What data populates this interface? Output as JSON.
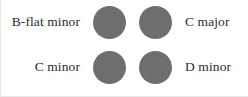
{
  "figure": {
    "background_color": "#ffffff",
    "dot_color": "#6e6e6e",
    "text_color": "#2b2b2b",
    "rows": [
      {
        "left_label": "B-flat minor",
        "right_label": "C major"
      },
      {
        "left_label": "C minor",
        "right_label": "D minor"
      }
    ],
    "dots": [
      {
        "row": 0,
        "column": 0
      },
      {
        "row": 0,
        "column": 1
      },
      {
        "row": 1,
        "column": 0
      },
      {
        "row": 1,
        "column": 1
      }
    ]
  }
}
